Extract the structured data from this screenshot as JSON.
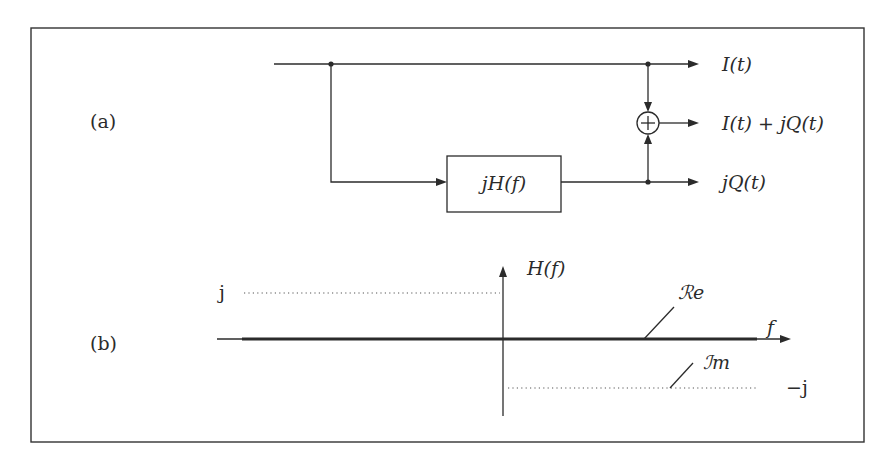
{
  "figure": {
    "panel_a": {
      "label": "(a)",
      "filter_block": "jH(f)",
      "adder_symbol": "+",
      "outputs": {
        "top": "I(t)",
        "middle": "I(t) + jQ(t)",
        "bottom": "jQ(t)"
      }
    },
    "panel_b": {
      "label": "(b)",
      "y_axis_label": "H(f)",
      "x_axis_label": "f",
      "level_pos": "j",
      "level_neg": "−j",
      "real_part_label": "ℛe",
      "imag_part_label": "ℐm"
    }
  }
}
